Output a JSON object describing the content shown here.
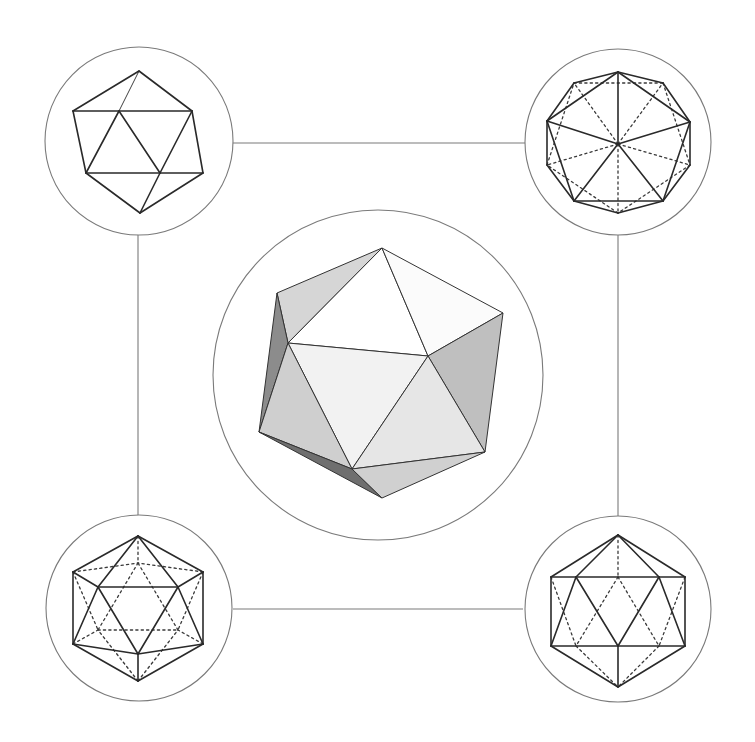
{
  "figure": {
    "background": "#ffffff",
    "line_color": "#2a2a2a",
    "frame_color": "#7a7a7a"
  },
  "connectors": [
    {
      "name": "top-connector",
      "x1": 233,
      "y1": 143,
      "x2": 525,
      "y2": 143
    },
    {
      "name": "bottom-connector",
      "x1": 233,
      "y1": 609,
      "x2": 523,
      "y2": 609
    },
    {
      "name": "left-connector",
      "x1": 138,
      "y1": 234,
      "x2": 138,
      "y2": 517
    },
    {
      "name": "right-connector",
      "x1": 618,
      "y1": 233,
      "x2": 618,
      "y2": 518
    }
  ],
  "views": {
    "top_left": {
      "label": "Icosahedron view along 2-fold axis (perspective outline)",
      "circle": {
        "cx": 139,
        "cy": 141,
        "r": 94
      },
      "vertices": {
        "T": [
          139,
          71
        ],
        "L": [
          73,
          111
        ],
        "I1": [
          119,
          111
        ],
        "R": [
          192,
          111
        ],
        "BL": [
          86,
          173
        ],
        "I2": [
          160,
          173
        ],
        "BR": [
          203,
          173
        ],
        "B": [
          140,
          213
        ]
      },
      "solid": [
        [
          "T",
          "L"
        ],
        [
          "T",
          "R"
        ],
        [
          "L",
          "R"
        ],
        [
          "L",
          "BL"
        ],
        [
          "I1",
          "BL"
        ],
        [
          "I1",
          "I2"
        ],
        [
          "R",
          "I2"
        ],
        [
          "R",
          "BR"
        ],
        [
          "BL",
          "BR"
        ],
        [
          "BL",
          "B"
        ],
        [
          "I2",
          "B"
        ],
        [
          "BR",
          "B"
        ]
      ],
      "thin": [
        [
          "T",
          "I1"
        ]
      ],
      "dashed": []
    },
    "top_right": {
      "label": "Icosahedron view along 5-fold axis",
      "circle": {
        "cx": 618,
        "cy": 142,
        "r": 93
      },
      "vertices": {
        "C": [
          618,
          144
        ],
        "P1": [
          618,
          72
        ],
        "P2": [
          690,
          122
        ],
        "P3": [
          663,
          201
        ],
        "P4": [
          574,
          201
        ],
        "P5": [
          547,
          121
        ],
        "Q1": [
          574,
          83
        ],
        "Q2": [
          663,
          83
        ],
        "Q3": [
          690,
          165
        ],
        "Q4": [
          618,
          213
        ],
        "Q5": [
          547,
          165
        ]
      },
      "solid": [
        [
          "C",
          "P1"
        ],
        [
          "C",
          "P2"
        ],
        [
          "C",
          "P3"
        ],
        [
          "C",
          "P4"
        ],
        [
          "C",
          "P5"
        ],
        [
          "P1",
          "P2"
        ],
        [
          "P2",
          "P3"
        ],
        [
          "P3",
          "P4"
        ],
        [
          "P4",
          "P5"
        ],
        [
          "P5",
          "P1"
        ],
        [
          "P1",
          "Q1"
        ],
        [
          "Q1",
          "P5"
        ],
        [
          "P1",
          "Q2"
        ],
        [
          "Q2",
          "P2"
        ],
        [
          "P2",
          "Q3"
        ],
        [
          "Q3",
          "P3"
        ],
        [
          "P3",
          "Q4"
        ],
        [
          "Q4",
          "P4"
        ],
        [
          "P4",
          "Q5"
        ],
        [
          "Q5",
          "P5"
        ]
      ],
      "thin": [],
      "dashed": [
        [
          "C",
          "Q1"
        ],
        [
          "C",
          "Q2"
        ],
        [
          "C",
          "Q3"
        ],
        [
          "C",
          "Q4"
        ],
        [
          "C",
          "Q5"
        ],
        [
          "Q1",
          "Q2"
        ],
        [
          "Q2",
          "Q3"
        ],
        [
          "Q3",
          "Q4"
        ],
        [
          "Q4",
          "Q5"
        ],
        [
          "Q5",
          "Q1"
        ]
      ]
    },
    "bottom_left": {
      "label": "Icosahedron view along 3-fold axis",
      "circle": {
        "cx": 139,
        "cy": 608,
        "r": 93
      },
      "vertices": {
        "T": [
          138,
          536
        ],
        "UL": [
          73,
          572
        ],
        "UR": [
          203,
          572
        ],
        "LL": [
          73,
          644
        ],
        "LR": [
          203,
          644
        ],
        "B": [
          138,
          681
        ],
        "F1": [
          98,
          587
        ],
        "F2": [
          178,
          587
        ],
        "F3": [
          138,
          654
        ],
        "K1": [
          138,
          563
        ],
        "K2": [
          98,
          630
        ],
        "K3": [
          178,
          630
        ]
      },
      "solid": [
        [
          "T",
          "UR"
        ],
        [
          "UR",
          "LR"
        ],
        [
          "LR",
          "B"
        ],
        [
          "B",
          "LL"
        ],
        [
          "LL",
          "UL"
        ],
        [
          "UL",
          "T"
        ],
        [
          "F1",
          "F2"
        ],
        [
          "F2",
          "F3"
        ],
        [
          "F3",
          "F1"
        ],
        [
          "T",
          "F1"
        ],
        [
          "T",
          "F2"
        ],
        [
          "UL",
          "F1"
        ],
        [
          "UR",
          "F2"
        ],
        [
          "LL",
          "F1"
        ],
        [
          "LR",
          "F2"
        ],
        [
          "LL",
          "F3"
        ],
        [
          "LR",
          "F3"
        ],
        [
          "B",
          "F3"
        ]
      ],
      "thin": [],
      "dashed": [
        [
          "K1",
          "K2"
        ],
        [
          "K2",
          "K3"
        ],
        [
          "K3",
          "K1"
        ],
        [
          "T",
          "K1"
        ],
        [
          "UL",
          "K1"
        ],
        [
          "UR",
          "K1"
        ],
        [
          "UL",
          "K2"
        ],
        [
          "LL",
          "K2"
        ],
        [
          "UR",
          "K3"
        ],
        [
          "LR",
          "K3"
        ],
        [
          "B",
          "K2"
        ],
        [
          "B",
          "K3"
        ]
      ]
    },
    "bottom_right": {
      "label": "Icosahedron view along 2-fold axis (front)",
      "circle": {
        "cx": 618,
        "cy": 609,
        "r": 93
      },
      "vertices": {
        "T": [
          618,
          535
        ],
        "A1": [
          551,
          577
        ],
        "A2": [
          576,
          577
        ],
        "Am": [
          618,
          577
        ],
        "A4": [
          659,
          577
        ],
        "A5": [
          685,
          577
        ],
        "C1": [
          551,
          646
        ],
        "C2": [
          576,
          646
        ],
        "Cm": [
          618,
          646
        ],
        "C4": [
          659,
          646
        ],
        "C5": [
          685,
          646
        ],
        "B": [
          618,
          687
        ]
      },
      "solid": [
        [
          "T",
          "A1"
        ],
        [
          "T",
          "A2"
        ],
        [
          "T",
          "A4"
        ],
        [
          "T",
          "A5"
        ],
        [
          "A1",
          "A5"
        ],
        [
          "A1",
          "C1"
        ],
        [
          "A5",
          "C5"
        ],
        [
          "C1",
          "C5"
        ],
        [
          "A2",
          "C1"
        ],
        [
          "A2",
          "Cm"
        ],
        [
          "A4",
          "Cm"
        ],
        [
          "A4",
          "C5"
        ],
        [
          "Cm",
          "B"
        ],
        [
          "C1",
          "B"
        ],
        [
          "C5",
          "B"
        ]
      ],
      "thin": [],
      "dashed": [
        [
          "T",
          "Am"
        ],
        [
          "Am",
          "C2"
        ],
        [
          "Am",
          "C4"
        ],
        [
          "A1",
          "C2"
        ],
        [
          "A5",
          "C4"
        ],
        [
          "C2",
          "B"
        ],
        [
          "C4",
          "B"
        ]
      ]
    },
    "center": {
      "label": "Shaded icosahedron",
      "circle": {
        "cx": 378,
        "cy": 375,
        "r": 165
      },
      "vertices": {
        "A": [
          382,
          248
        ],
        "B": [
          277,
          293
        ],
        "C": [
          288,
          343
        ],
        "D": [
          428,
          356
        ],
        "E": [
          503,
          313
        ],
        "F": [
          259,
          432
        ],
        "G": [
          352,
          469
        ],
        "H": [
          485,
          452
        ],
        "I": [
          382,
          498
        ]
      },
      "faces": [
        {
          "v": [
            "A",
            "B",
            "C"
          ],
          "fill": "#d6d6d6"
        },
        {
          "v": [
            "A",
            "C",
            "D"
          ],
          "fill": "#ffffff"
        },
        {
          "v": [
            "A",
            "D",
            "E"
          ],
          "fill": "#fbfbfb"
        },
        {
          "v": [
            "C",
            "D",
            "G"
          ],
          "fill": "#f2f2f2"
        },
        {
          "v": [
            "D",
            "E",
            "H"
          ],
          "fill": "#bfbfbf"
        },
        {
          "v": [
            "D",
            "G",
            "H"
          ],
          "fill": "#e6e6e6"
        },
        {
          "v": [
            "B",
            "C",
            "F"
          ],
          "fill": "#8c8c8c"
        },
        {
          "v": [
            "C",
            "F",
            "G"
          ],
          "fill": "#cfcfcf"
        },
        {
          "v": [
            "F",
            "G",
            "I"
          ],
          "fill": "#6f6f6f"
        },
        {
          "v": [
            "G",
            "H",
            "I"
          ],
          "fill": "#d0d0d0"
        }
      ]
    }
  }
}
